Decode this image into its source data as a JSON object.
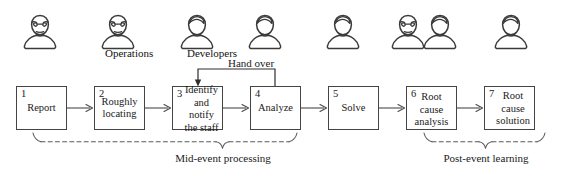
{
  "diagram": {
    "stroke_color": "#3a3a3a",
    "box_border_color": "#444444",
    "background_color": "#ffffff",
    "actors": [
      {
        "id": "actor-1",
        "icon": "person-with-glasses-icon",
        "caption": "",
        "x": 18,
        "y": 10
      },
      {
        "id": "actor-2",
        "icon": "person-with-glasses-icon",
        "caption": "Operations",
        "x": 96,
        "y": 10
      },
      {
        "id": "actor-3",
        "icon": "person-wavy-hair-icon",
        "caption": "Developers",
        "x": 175,
        "y": 10
      },
      {
        "id": "actor-4",
        "icon": "person-wavy-hair-icon",
        "caption": "",
        "x": 243,
        "y": 10
      },
      {
        "id": "actor-5",
        "icon": "person-wavy-hair-icon",
        "caption": "",
        "x": 321,
        "y": 10
      },
      {
        "id": "actor-6",
        "icon": "person-with-glasses-icon",
        "caption": "",
        "x": 386,
        "y": 10
      },
      {
        "id": "actor-7",
        "icon": "person-wavy-hair-icon",
        "caption": "",
        "x": 418,
        "y": 10
      },
      {
        "id": "actor-8",
        "icon": "person-wavy-hair-icon",
        "caption": "",
        "x": 489,
        "y": 10
      }
    ],
    "steps": [
      {
        "number": "1",
        "label": "Report",
        "inline": false,
        "x": 16,
        "y": 86,
        "w": 51,
        "h": 44
      },
      {
        "number": "2",
        "label": "Roughly locating",
        "inline": false,
        "x": 94,
        "y": 86,
        "w": 51,
        "h": 44
      },
      {
        "number": "3",
        "label": "Identify and notify the staff",
        "inline": true,
        "x": 172,
        "y": 86,
        "w": 51,
        "h": 44
      },
      {
        "number": "4",
        "label": "Analyze",
        "inline": false,
        "x": 250,
        "y": 86,
        "w": 51,
        "h": 44
      },
      {
        "number": "5",
        "label": "Solve",
        "inline": false,
        "x": 328,
        "y": 86,
        "w": 51,
        "h": 44
      },
      {
        "number": "6",
        "label": "Root cause analysis",
        "inline": false,
        "x": 406,
        "y": 86,
        "w": 51,
        "h": 44
      },
      {
        "number": "7",
        "label": "Root cause solution",
        "inline": true,
        "x": 484,
        "y": 86,
        "w": 51,
        "h": 44
      }
    ],
    "handover": {
      "label": "Hand over",
      "label_x": 228,
      "label_y": 57,
      "from_step": "4",
      "to_step": "3"
    },
    "phases": [
      {
        "id": "phase-mid-event",
        "label": "Mid-event processing",
        "label_x": 229,
        "label_y": 153,
        "bracket_left": 33,
        "bracket_right": 297,
        "bracket_y": 143,
        "notch_x": 222
      },
      {
        "id": "phase-post-event",
        "label": "Post-event learning",
        "label_x": 438,
        "label_y": 153,
        "bracket_left": 424,
        "bracket_right": 545,
        "bracket_y": 143,
        "notch_x": 485
      }
    ]
  }
}
